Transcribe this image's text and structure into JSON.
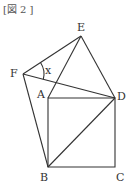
{
  "caption": "[図 2 ]",
  "points": {
    "A": {
      "label": "A",
      "x": 48,
      "y": 98
    },
    "B": {
      "label": "B",
      "x": 48,
      "y": 167
    },
    "C": {
      "label": "C",
      "x": 115,
      "y": 167
    },
    "D": {
      "label": "D",
      "x": 115,
      "y": 98
    },
    "E": {
      "label": "E",
      "x": 81,
      "y": 36
    },
    "F": {
      "label": "F",
      "x": 23,
      "y": 74
    }
  },
  "angle_label": "x",
  "colors": {
    "stroke": "#333333",
    "background": "#ffffff"
  }
}
